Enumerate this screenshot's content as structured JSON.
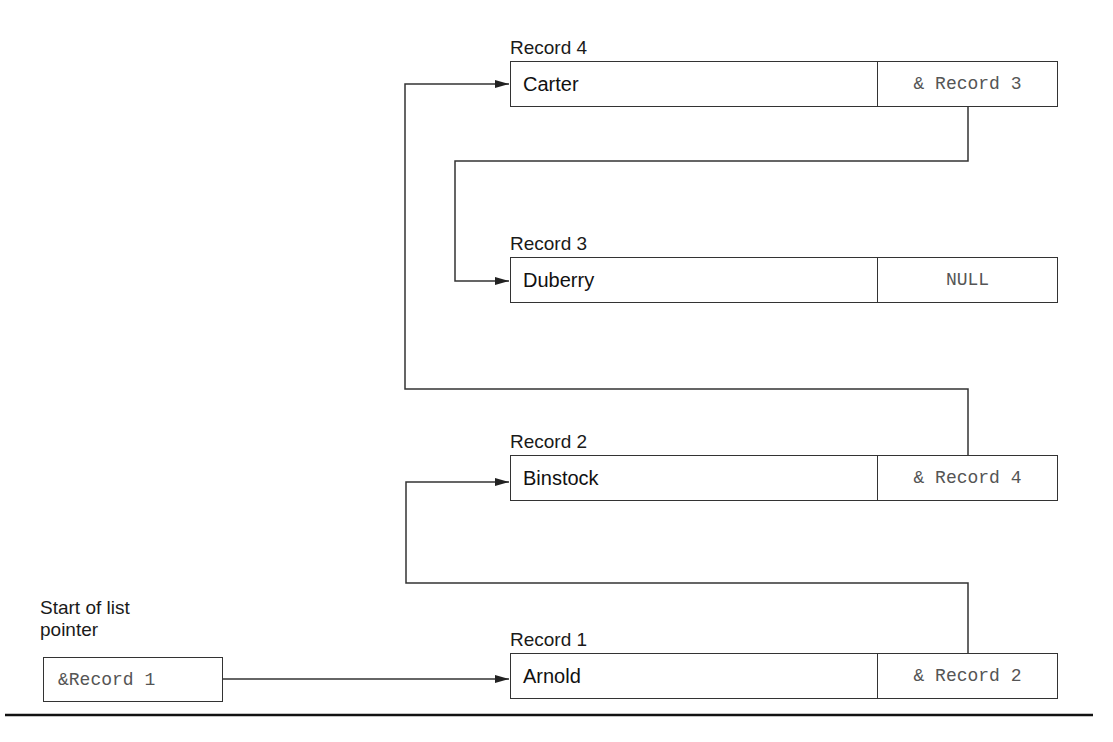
{
  "records": [
    {
      "label": "Record 4",
      "name": "Carter",
      "pointer": "& Record 3"
    },
    {
      "label": "Record 3",
      "name": "Duberry",
      "pointer": "NULL"
    },
    {
      "label": "Record 2",
      "name": "Binstock",
      "pointer": "& Record 4"
    },
    {
      "label": "Record 1",
      "name": "Arnold",
      "pointer": "& Record 2"
    }
  ],
  "start": {
    "label_line1": "Start of list",
    "label_line2": "pointer",
    "value": "&Record 1"
  },
  "colors": {
    "line": "#333333",
    "pointer_text": "#555555"
  }
}
